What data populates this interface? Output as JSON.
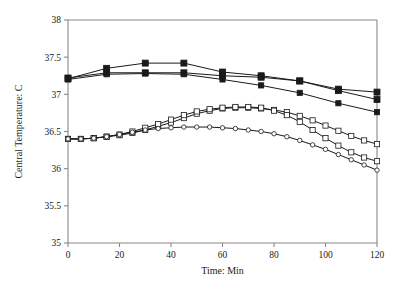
{
  "chart_data": {
    "type": "line",
    "title": "",
    "subtitle": "",
    "xlabel": "Time: Min",
    "ylabel": "Central Temperature: C",
    "xlim": [
      0,
      120
    ],
    "ylim": [
      35,
      38
    ],
    "xticks": [
      0,
      20,
      40,
      60,
      80,
      100,
      120
    ],
    "xticklabels": [
      "0",
      "20",
      "40",
      "60",
      "80",
      "100",
      "120"
    ],
    "yticks": [
      35,
      35.5,
      36,
      36.5,
      37,
      37.5,
      38
    ],
    "yticklabels": [
      "35",
      "35.5",
      "36",
      "36.5",
      "37",
      "37.5",
      "38"
    ],
    "grid": false,
    "legend": "none",
    "annotations": [],
    "series": [
      {
        "name": "upper-series-1",
        "marker": "filled-square",
        "marker_size": 3.0,
        "x": [
          0,
          15,
          30,
          45,
          60,
          75,
          90,
          105,
          120
        ],
        "y": [
          37.21,
          37.35,
          37.42,
          37.42,
          37.3,
          37.25,
          37.18,
          37.07,
          37.03
        ]
      },
      {
        "name": "upper-series-2",
        "marker": "filled-square",
        "marker_size": 3.0,
        "x": [
          0,
          15,
          30,
          45,
          60,
          75,
          90,
          105,
          120
        ],
        "y": [
          37.22,
          37.29,
          37.29,
          37.29,
          37.25,
          37.23,
          37.18,
          37.05,
          36.93
        ]
      },
      {
        "name": "upper-series-3",
        "marker": "filled-square",
        "marker_size": 2.6,
        "x": [
          0,
          15,
          30,
          45,
          60,
          75,
          90,
          105,
          120
        ],
        "y": [
          37.2,
          37.27,
          37.28,
          37.27,
          37.2,
          37.12,
          37.02,
          36.88,
          36.76
        ]
      },
      {
        "name": "lower-series-1",
        "marker": "open-square",
        "marker_size": 2.6,
        "x": [
          0,
          5,
          10,
          15,
          20,
          25,
          30,
          35,
          40,
          45,
          50,
          55,
          60,
          65,
          70,
          75,
          80,
          85,
          90,
          95,
          100,
          105,
          110,
          115,
          120
        ],
        "y": [
          36.4,
          36.4,
          36.41,
          36.43,
          36.45,
          36.48,
          36.52,
          36.57,
          36.62,
          36.68,
          36.74,
          36.78,
          36.81,
          36.82,
          36.82,
          36.81,
          36.79,
          36.76,
          36.71,
          36.65,
          36.58,
          36.51,
          36.44,
          36.38,
          36.33
        ]
      },
      {
        "name": "lower-series-2",
        "marker": "open-square",
        "marker_size": 2.6,
        "x": [
          0,
          5,
          10,
          15,
          20,
          25,
          30,
          35,
          40,
          45,
          50,
          55,
          60,
          65,
          70,
          75,
          80,
          85,
          90,
          95,
          100,
          105,
          110,
          115,
          120
        ],
        "y": [
          36.4,
          36.4,
          36.41,
          36.43,
          36.46,
          36.5,
          36.55,
          36.6,
          36.66,
          36.72,
          36.77,
          36.8,
          36.82,
          36.83,
          36.83,
          36.82,
          36.78,
          36.72,
          36.63,
          36.52,
          36.41,
          36.31,
          36.22,
          36.15,
          36.1
        ]
      },
      {
        "name": "lower-series-3",
        "marker": "open-circle",
        "marker_size": 2.6,
        "x": [
          0,
          5,
          10,
          15,
          20,
          25,
          30,
          35,
          40,
          45,
          50,
          55,
          60,
          65,
          70,
          75,
          80,
          85,
          90,
          95,
          100,
          105,
          110,
          115,
          120
        ],
        "y": [
          36.4,
          36.4,
          36.41,
          36.43,
          36.46,
          36.49,
          36.52,
          36.54,
          36.55,
          36.56,
          36.56,
          36.56,
          36.55,
          36.54,
          36.52,
          36.5,
          36.47,
          36.43,
          36.38,
          36.32,
          36.26,
          36.19,
          36.12,
          36.05,
          35.98
        ]
      }
    ]
  },
  "figure": {
    "background": "#ffffff",
    "axis_color": "#888888",
    "line_color": "#1a1a1a"
  }
}
